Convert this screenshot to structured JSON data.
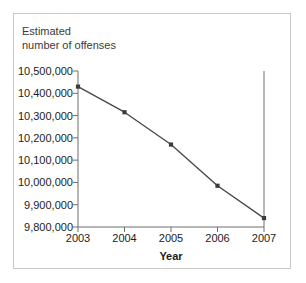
{
  "figure": {
    "border_color": "#c9c9c9",
    "background": "#ffffff"
  },
  "chart_data": {
    "type": "line",
    "title": "Estimated\nnumber of offenses",
    "xlabel": "Year",
    "ylabel": "",
    "categories": [
      "2003",
      "2004",
      "2005",
      "2006",
      "2007"
    ],
    "x": [
      2003,
      2004,
      2005,
      2006,
      2007
    ],
    "values": [
      10430000,
      10315000,
      10170000,
      9985000,
      9840000
    ],
    "series": [
      {
        "name": "Estimated number of offenses",
        "values": [
          10430000,
          10315000,
          10170000,
          9985000,
          9840000
        ]
      }
    ],
    "ylim": [
      9800000,
      10500000
    ],
    "xlim": [
      2003,
      2007
    ],
    "ytick_values": [
      10500000,
      10400000,
      10300000,
      10200000,
      10100000,
      10000000,
      9900000,
      9800000
    ],
    "ytick_labels": [
      "10,500,000",
      "10,400,000",
      "10,300,000",
      "10,200,000",
      "10,100,000",
      "10,000,000",
      "9,900,000",
      "9,800,000"
    ],
    "xtick_labels": [
      "2003",
      "2004",
      "2005",
      "2006",
      "2007"
    ],
    "grid": false,
    "legend": "none",
    "line_color": "#4a4a4a",
    "marker": "square",
    "marker_color": "#3c3c3c",
    "axis_color": "#6e6e6e"
  }
}
